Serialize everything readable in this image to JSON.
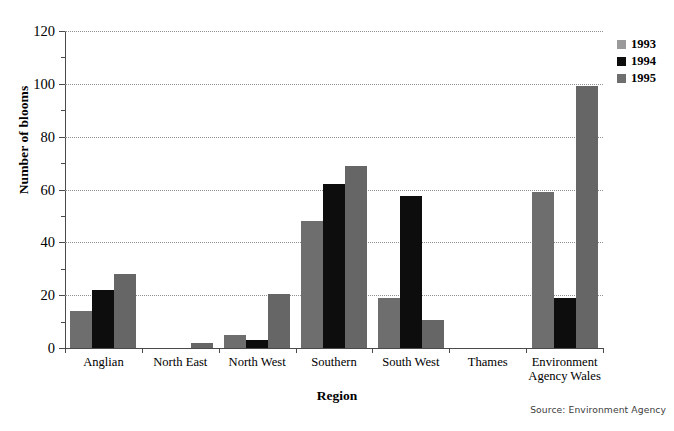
{
  "chart_data": {
    "type": "bar",
    "title": "",
    "xlabel": "Region",
    "ylabel": "Number of blooms",
    "ylim": [
      0,
      120
    ],
    "ytick_step": 20,
    "yticks": [
      0,
      20,
      40,
      60,
      80,
      100,
      120
    ],
    "ytick_labels": [
      "0",
      "20",
      "40",
      "60",
      "80",
      "100",
      "120"
    ],
    "minor_ytick_step": 10,
    "grid": true,
    "grid_axis": "y",
    "grid_style": "dotted",
    "legend_position": "top-right",
    "categories": [
      "Anglian",
      "North East",
      "North West",
      "Southern",
      "South West",
      "Thames",
      "Environment Agency Wales"
    ],
    "series": [
      {
        "name": "1993",
        "color": "#6e6e6e",
        "values": [
          14,
          0,
          5,
          48,
          19,
          0,
          59
        ]
      },
      {
        "name": "1994",
        "color": "#0d0d0d",
        "values": [
          22,
          0,
          3,
          62,
          57.5,
          0,
          19
        ]
      },
      {
        "name": "1995",
        "color": "#666666",
        "values": [
          28,
          2,
          20.5,
          69,
          10.5,
          0,
          99
        ]
      }
    ],
    "source": "Source: Environment Agency"
  },
  "axes": {
    "y_title": "Number of blooms",
    "x_title": "Region"
  },
  "legend": {
    "items": [
      {
        "label": "1993",
        "color": "#9a9a9a"
      },
      {
        "label": "1994",
        "color": "#0d0d0d"
      },
      {
        "label": "1995",
        "color": "#6e6e6e"
      }
    ]
  },
  "footer": {
    "source": "Source: Environment Agency"
  }
}
